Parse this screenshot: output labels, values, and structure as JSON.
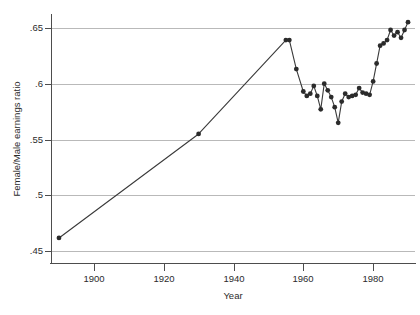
{
  "chart_data": {
    "type": "line",
    "title": "",
    "xlabel": "Year",
    "ylabel": "Female/Male earnings ratio",
    "xlim": [
      1888,
      1992
    ],
    "ylim": [
      0.4405,
      0.6605
    ],
    "grid": true,
    "legend": false,
    "marker": "filled-circle",
    "line_color": "#3a3a3a",
    "marker_color": "#2b2b2b",
    "grid_color": "#b9b9b9",
    "xticks": [
      1900,
      1920,
      1940,
      1960,
      1980
    ],
    "xtick_labels": [
      "1900",
      "1920",
      "1940",
      "1960",
      "1980"
    ],
    "yticks": [
      0.45,
      0.5,
      0.55,
      0.6,
      0.65
    ],
    "ytick_labels": [
      ".45",
      ".5",
      ".55",
      ".6",
      ".65"
    ],
    "series": [
      {
        "name": "Female/Male earnings ratio",
        "x": [
          1890,
          1930,
          1955,
          1956,
          1958,
          1960,
          1961,
          1962,
          1963,
          1964,
          1965,
          1966,
          1967,
          1968,
          1969,
          1970,
          1971,
          1972,
          1973,
          1974,
          1975,
          1976,
          1977,
          1978,
          1979,
          1980,
          1981,
          1982,
          1983,
          1984,
          1985,
          1986,
          1987,
          1988,
          1989,
          1990
        ],
        "y": [
          0.462,
          0.555,
          0.639,
          0.639,
          0.613,
          0.593,
          0.589,
          0.591,
          0.598,
          0.589,
          0.577,
          0.6,
          0.594,
          0.588,
          0.579,
          0.565,
          0.584,
          0.591,
          0.588,
          0.589,
          0.59,
          0.596,
          0.592,
          0.591,
          0.59,
          0.602,
          0.618,
          0.634,
          0.636,
          0.639,
          0.648,
          0.643,
          0.646,
          0.641,
          0.648,
          0.655
        ]
      }
    ]
  }
}
